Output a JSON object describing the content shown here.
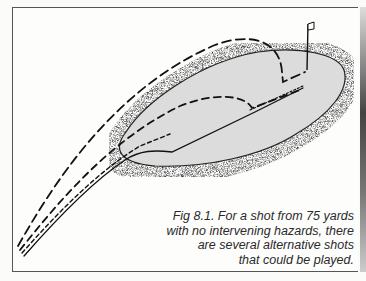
{
  "figure": {
    "caption_lines": [
      "Fig 8.1. For a shot from 75 yards",
      "with no intervening hazards, there",
      "are several alternative shots",
      "that could be played."
    ],
    "elements": {
      "green": "putting-green",
      "flag": "flagstick",
      "shots": [
        "high-pitch-shot",
        "pitch-and-run-shot",
        "chip-and-run-shot",
        "low-run-shot"
      ]
    },
    "colors": {
      "green_fill": "#dcdcdc",
      "fringe": "#222222",
      "lines": "#111111"
    }
  }
}
